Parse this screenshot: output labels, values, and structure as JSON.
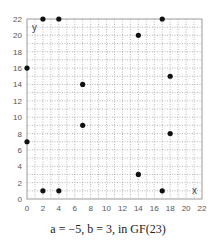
{
  "chart_data": {
    "type": "scatter",
    "title": "",
    "caption": "a = −5, b = 3, in GF(23)",
    "xlabel": "x",
    "ylabel": "y",
    "xlim": [
      0,
      22
    ],
    "ylim": [
      0,
      22
    ],
    "xticks": [
      0,
      2,
      4,
      6,
      8,
      10,
      12,
      14,
      16,
      18,
      20,
      22
    ],
    "yticks": [
      0,
      2,
      4,
      6,
      8,
      10,
      12,
      14,
      16,
      18,
      20,
      22
    ],
    "grid": "dotted, every 1 unit",
    "points": [
      {
        "x": 0,
        "y": 7
      },
      {
        "x": 0,
        "y": 16
      },
      {
        "x": 2,
        "y": 1
      },
      {
        "x": 2,
        "y": 22
      },
      {
        "x": 4,
        "y": 1
      },
      {
        "x": 4,
        "y": 22
      },
      {
        "x": 7,
        "y": 9
      },
      {
        "x": 7,
        "y": 14
      },
      {
        "x": 14,
        "y": 3
      },
      {
        "x": 14,
        "y": 20
      },
      {
        "x": 17,
        "y": 1
      },
      {
        "x": 17,
        "y": 22
      },
      {
        "x": 18,
        "y": 8
      },
      {
        "x": 18,
        "y": 15
      }
    ],
    "colors": {
      "point": "#111111",
      "grid": "#888888",
      "frame": "#999999",
      "text": "#555555"
    }
  }
}
